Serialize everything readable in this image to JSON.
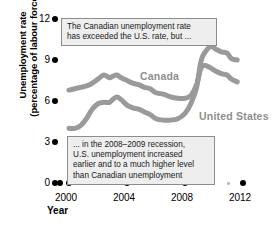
{
  "chart_data": {
    "type": "line",
    "title": "",
    "xlabel": "Year",
    "ylabel": "Unemployment rate (percentage of labour force)",
    "ylabel_line1": "Unemployment rate",
    "ylabel_line2": "(percentage of labour force)",
    "xlim": [
      1999.6,
      2012.4
    ],
    "ylim": [
      0,
      12
    ],
    "grid": false,
    "legend_position": "inline-labels",
    "y_ticks": [
      "12",
      "9",
      "6",
      "3",
      "0"
    ],
    "y_tick_values": [
      12,
      9,
      6,
      3,
      0
    ],
    "x_ticks": [
      "2000",
      "2004",
      "2008",
      "2012"
    ],
    "x_tick_values": [
      2000,
      2004,
      2008,
      2012
    ],
    "x_minor_values": [
      2001,
      2002,
      2003,
      2005,
      2006,
      2007,
      2009,
      2010,
      2011
    ],
    "series": [
      {
        "name": "Canada",
        "color": "#9a9a9a",
        "x": [
          2000.0,
          2000.4,
          2000.8,
          2001.2,
          2001.6,
          2002.0,
          2002.4,
          2002.8,
          2003.0,
          2003.3,
          2003.6,
          2004.0,
          2004.4,
          2004.8,
          2005.2,
          2005.6,
          2006.0,
          2006.5,
          2007.0,
          2007.5,
          2008.0,
          2008.4,
          2008.8,
          2009.1,
          2009.4,
          2009.8,
          2010.1,
          2010.5,
          2010.9,
          2011.2,
          2011.6
        ],
        "values": [
          6.8,
          6.9,
          7.0,
          7.1,
          7.3,
          7.6,
          7.9,
          7.7,
          7.8,
          7.9,
          7.7,
          7.5,
          7.3,
          7.2,
          7.0,
          6.9,
          6.6,
          6.5,
          6.3,
          6.2,
          6.2,
          6.4,
          7.2,
          8.4,
          8.6,
          8.4,
          8.2,
          8.0,
          7.9,
          7.6,
          7.4
        ]
      },
      {
        "name": "United States",
        "color": "#9a9a9a",
        "x": [
          2000.0,
          2000.4,
          2000.8,
          2001.2,
          2001.6,
          2002.0,
          2002.4,
          2002.8,
          2003.0,
          2003.3,
          2003.6,
          2004.0,
          2004.4,
          2004.8,
          2005.2,
          2005.6,
          2006.0,
          2006.5,
          2007.0,
          2007.5,
          2008.0,
          2008.4,
          2008.8,
          2009.1,
          2009.4,
          2009.8,
          2010.1,
          2010.5,
          2010.9,
          2011.2,
          2011.6
        ],
        "values": [
          4.0,
          4.0,
          4.2,
          4.7,
          5.4,
          5.8,
          5.9,
          5.9,
          6.1,
          6.3,
          6.1,
          5.7,
          5.5,
          5.4,
          5.2,
          5.0,
          4.7,
          4.6,
          4.6,
          4.7,
          5.1,
          5.8,
          7.0,
          8.9,
          9.6,
          10.0,
          9.8,
          9.6,
          9.5,
          9.1,
          9.0
        ]
      }
    ],
    "annotations": [
      {
        "id": "callout-top",
        "lines": [
          "The Canadian unemployment rate",
          "has exceeded the U.S. rate, but ..."
        ]
      },
      {
        "id": "callout-bottom",
        "lines": [
          "... in the 2008–2009 recession,",
          "U.S. unemployment increased",
          "earlier and to a much higher level",
          "than Canadian unemployment"
        ]
      }
    ],
    "series_labels": [
      {
        "name": "Canada",
        "text": "Canada"
      },
      {
        "name": "United States",
        "text": "United States"
      }
    ]
  },
  "colors": {
    "line": "#9a9a9a",
    "axis_text": "#000000",
    "callout_bg": "#eeeeee",
    "callout_border": "#8d8d8d",
    "label_gray": "#8f8f8f",
    "minor_dot": "#b8b8b8"
  }
}
